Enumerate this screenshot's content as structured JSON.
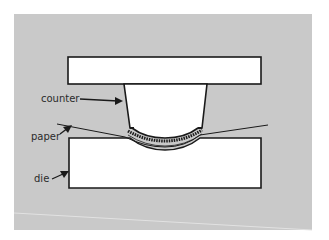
{
  "diagram": {
    "type": "embossing press cross-section",
    "labels": {
      "counter": "counter",
      "paper": "paper",
      "die": "die"
    },
    "colors": {
      "background": "#c9c9c9",
      "parts_fill": "#ffffff",
      "outline": "#1a1a1a",
      "label_text": "#2b2b2b"
    },
    "parts": [
      "upper plate",
      "counter",
      "paper",
      "die"
    ]
  }
}
